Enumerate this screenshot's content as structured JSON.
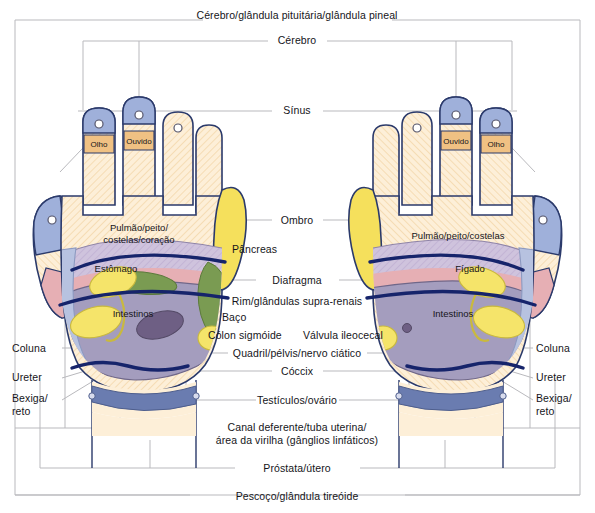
{
  "chart": {
    "type": "diagram",
    "language": "pt-BR",
    "frame_color": "#b9b9bd",
    "leader_line_color": "#9a9aa2",
    "outline_color": "#2b3a6b",
    "band_color": "#16246b"
  },
  "center_labels": [
    {
      "id": "cerebro-pituitaria-pineal",
      "text": "Cérebro/glândula pituitária/glândula pineal",
      "x": 297,
      "y": 16
    },
    {
      "id": "cerebro",
      "text": "Cérebro",
      "x": 297,
      "y": 37
    },
    {
      "id": "sinus",
      "text": "Sínus",
      "x": 297,
      "y": 110
    },
    {
      "id": "ombro",
      "text": "Ombro",
      "x": 297,
      "y": 219
    },
    {
      "id": "pancreas",
      "text": "Pâncreas",
      "x": 262,
      "y": 249
    },
    {
      "id": "diafragma",
      "text": "Diafragma",
      "x": 297,
      "y": 279
    },
    {
      "id": "rim-glandulas-supra-renais",
      "text": "Rim/glândulas supra-renais",
      "x": 297,
      "y": 300
    },
    {
      "id": "baco",
      "text": "Baço",
      "x": 243,
      "y": 316
    },
    {
      "id": "colon-sigmoide",
      "text": "Cólon sigmóide",
      "x": 258,
      "y": 334
    },
    {
      "id": "valvula-ileocecal",
      "text": "Válvula ileocecal",
      "x": 343,
      "y": 334
    },
    {
      "id": "quadril-pelvis-nervo-ciatico",
      "text": "Quadril/pélvis/nervo ciático",
      "x": 297,
      "y": 352
    },
    {
      "id": "coccix",
      "text": "Cóccix",
      "x": 297,
      "y": 370
    },
    {
      "id": "testiculos-ovario",
      "text": "Testículos/ovário",
      "x": 297,
      "y": 400
    },
    {
      "id": "canal-deferente-tuba-uterina",
      "text": "Canal deferente/tuba uterina/",
      "x": 297,
      "y": 427
    },
    {
      "id": "area-virilha-ganglios",
      "text": "área da virilha (gânglios linfáticos)",
      "x": 297,
      "y": 440
    },
    {
      "id": "prostata-utero",
      "text": "Próstata/útero",
      "x": 297,
      "y": 468
    },
    {
      "id": "pescoco-glandula-tireoide",
      "text": "Pescoço/glândula tireóide",
      "x": 297,
      "y": 496
    }
  ],
  "side_labels": [
    {
      "id": "coluna-esquerda",
      "text": "Coluna",
      "x": 30,
      "y": 348
    },
    {
      "id": "ureter-esquerdo",
      "text": "Ureter",
      "x": 30,
      "y": 377
    },
    {
      "id": "bexiga-reto-esquerdo",
      "line1": "Bexiga/",
      "line2": "reto",
      "x": 30,
      "y": 398
    },
    {
      "id": "coluna-direita",
      "text": "Coluna",
      "x": 535,
      "y": 348
    },
    {
      "id": "ureter-direito",
      "text": "Ureter",
      "x": 535,
      "y": 377
    },
    {
      "id": "bexiga-reto-direito",
      "line1": "Bexiga/",
      "line2": "reto",
      "x": 535,
      "y": 398
    }
  ],
  "left_hand": {
    "name": "mão esquerda",
    "zones": [
      {
        "id": "olho-esquerdo",
        "label": "Olho",
        "x": 99,
        "y": 143
      },
      {
        "id": "ouvido-esquerdo",
        "label": "Ouvido",
        "x": 154,
        "y": 140
      },
      {
        "id": "pulmao-peito-costelas-coracao",
        "label": "Pulmão/peito/\ncostelas/coração",
        "x": 139,
        "y": 233
      },
      {
        "id": "estomago",
        "label": "Estômago",
        "x": 116,
        "y": 268
      },
      {
        "id": "intestinos-esquerdo",
        "label": "Intestinos",
        "x": 133,
        "y": 313
      }
    ]
  },
  "right_hand": {
    "name": "mão direita",
    "zones": [
      {
        "id": "ouvido-direito",
        "label": "Ouvido",
        "x": 442,
        "y": 140
      },
      {
        "id": "olho-direito",
        "label": "Olho",
        "x": 497,
        "y": 143
      },
      {
        "id": "pulmao-peito-costelas",
        "label": "Pulmão/peito/costelas",
        "x": 460,
        "y": 236
      },
      {
        "id": "figado",
        "label": "Fígado",
        "x": 466,
        "y": 268
      },
      {
        "id": "intestinos-direito",
        "label": "Intestinos",
        "x": 448,
        "y": 313
      }
    ]
  },
  "palette": {
    "skin": "#fdefd8",
    "skin_hatch": "#f6dcb6",
    "fingertip_blue": "#9fb0da",
    "eye_ear_orange": "#f0c183",
    "lung_lilac": "#cfc3dd",
    "diaphragm_pink": "#e6afb4",
    "intestine_purple": "#a49dbe",
    "kidney_yellow": "#f5e46a",
    "spleen_green": "#7a9b52",
    "sigmoid_purple": "#6e5f84",
    "shoulder_yellow": "#f5e05c",
    "spine_blue": "#b7c2e0",
    "bladder_blue": "#6a7cb0",
    "band_navy": "#16246b"
  }
}
